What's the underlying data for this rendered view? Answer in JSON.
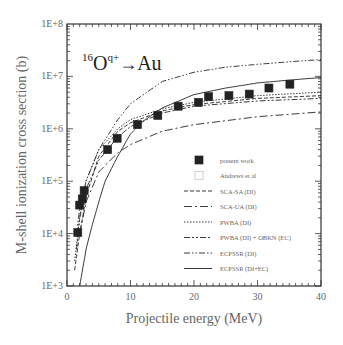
{
  "chart_data": {
    "type": "line",
    "title": "",
    "annotation": {
      "mass": "16",
      "ion": "O",
      "charge": "q+",
      "arrow": "→",
      "target": "Au"
    },
    "xlabel": "Projectile energy (MeV)",
    "ylabel": "M-shell ionization cross section (b)",
    "xlim": [
      0,
      40
    ],
    "ylim": [
      1000,
      100000000
    ],
    "yscale": "log",
    "xticks": [
      "0",
      "10",
      "20",
      "30",
      "40"
    ],
    "yticks": [
      "1E+3",
      "1E+4",
      "1E+5",
      "1E+6",
      "1E+7",
      "1E+8"
    ],
    "grid": false,
    "legend_position": "lower right",
    "series": [
      {
        "name": "present work",
        "kind": "scatter",
        "marker": "filled-square",
        "x": [
          1.7,
          2.0,
          2.4,
          2.7,
          6.4,
          7.9,
          11.1,
          14.3,
          17.5,
          20.7,
          22.3,
          25.5,
          28.7,
          31.8,
          35.1
        ],
        "y": [
          10500,
          35000,
          46000,
          66000,
          400000,
          660000,
          1200000,
          1800000,
          2700000,
          3200000,
          4100000,
          4300000,
          4600000,
          6000000,
          7100000
        ]
      },
      {
        "name": "Andrews et al",
        "kind": "scatter",
        "marker": "open-square",
        "x": [],
        "y": []
      },
      {
        "name": "SCA-SA (DI)",
        "kind": "line",
        "dash": "4,2",
        "x": [
          1.2,
          2,
          3,
          5,
          8,
          10,
          15,
          20,
          30,
          40
        ],
        "y": [
          2000,
          10000,
          50000,
          300000,
          900000,
          1300000,
          2200000,
          2900000,
          3800000,
          4300000
        ]
      },
      {
        "name": "SCA-UA (DI)",
        "kind": "line",
        "dash": "8,3,2,3",
        "x": [
          2,
          3,
          5,
          8,
          10,
          15,
          20,
          30,
          40
        ],
        "y": [
          10000,
          40000,
          150000,
          350000,
          500000,
          900000,
          1200000,
          1700000,
          2100000
        ]
      },
      {
        "name": "PWBA (DI)",
        "kind": "line",
        "dash": "1.5,1.5",
        "x": [
          1.2,
          2,
          3,
          5,
          8,
          10,
          15,
          20,
          30,
          40
        ],
        "y": [
          3000,
          20000,
          100000,
          400000,
          1000000,
          1500000,
          2400000,
          3200000,
          4300000,
          5000000
        ]
      },
      {
        "name": "PWBA (DI) + OBKN (EC)",
        "kind": "line",
        "dash": "6,2,2,2,2,2",
        "x": [
          1.5,
          2,
          3,
          5,
          8,
          10,
          15,
          20,
          30,
          40
        ],
        "y": [
          5000,
          20000,
          70000,
          250000,
          700000,
          1100000,
          2000000,
          2700000,
          3400000,
          3800000
        ]
      },
      {
        "name": "ECPSSR (DI)",
        "kind": "line",
        "dash": "6,2,1.5,2,1.5,2",
        "x": [
          1.5,
          2,
          3,
          5,
          8,
          10,
          15,
          20,
          25,
          30,
          35,
          40
        ],
        "y": [
          10000,
          30000,
          100000,
          400000,
          1500000,
          3000000,
          8000000,
          12000000,
          15000000,
          17000000,
          19000000,
          21000000
        ]
      },
      {
        "name": "ECPSSR (DI+EC)",
        "kind": "line",
        "dash": "",
        "x": [
          2,
          3,
          4,
          5,
          6,
          8,
          10,
          12,
          15,
          20,
          25,
          30,
          35,
          40
        ],
        "y": [
          1000,
          5000,
          15000,
          40000,
          100000,
          300000,
          800000,
          1400000,
          2500000,
          4500000,
          6000000,
          7500000,
          8500000,
          9500000
        ]
      }
    ]
  },
  "colors": {
    "axis": "#333333",
    "text": "#666666",
    "series": "#222222",
    "marker": "#222222"
  }
}
